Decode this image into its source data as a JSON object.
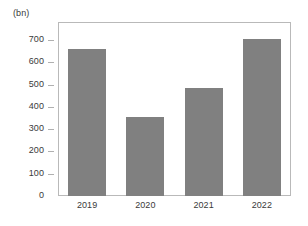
{
  "chart_data": {
    "type": "bar",
    "title": "",
    "subtitle": "",
    "unit_label": "(bn)",
    "xlabel": "",
    "ylabel": "",
    "categories": [
      "2019",
      "2020",
      "2021",
      "2022"
    ],
    "values": [
      660,
      355,
      485,
      705
    ],
    "series": [
      {
        "name": "",
        "values": [
          660,
          355,
          485,
          705
        ]
      }
    ],
    "ylim": [
      0,
      700
    ],
    "yticks": [
      0,
      100,
      200,
      300,
      400,
      500,
      600,
      700
    ],
    "ytick_labels": [
      "0",
      "100",
      "200",
      "300",
      "400",
      "500",
      "600",
      "700"
    ],
    "grid": false,
    "legend": false,
    "legend_position": "none",
    "bar_color": "#808080",
    "axis_color": "#b9b9b9",
    "text_color": "#3a3a3a",
    "annotations": []
  }
}
